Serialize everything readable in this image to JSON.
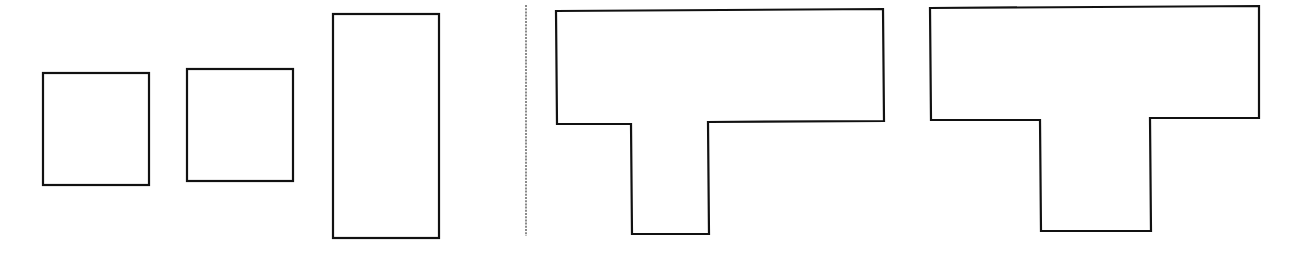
{
  "diagram": {
    "title": "",
    "colors": {
      "stroke": "#111111",
      "fill": "#ffffff",
      "divider": "#8a8a8a",
      "background": "#ffffff"
    },
    "left_group": {
      "shapes": [
        {
          "id": "square-1",
          "kind": "rectangle"
        },
        {
          "id": "square-2",
          "kind": "rectangle"
        },
        {
          "id": "tall-rectangle",
          "kind": "rectangle"
        }
      ]
    },
    "divider": {
      "style": "dotted"
    },
    "right_group": {
      "shapes": [
        {
          "id": "t-shape-1",
          "kind": "T-polygon"
        },
        {
          "id": "t-shape-2",
          "kind": "T-polygon"
        }
      ]
    }
  }
}
